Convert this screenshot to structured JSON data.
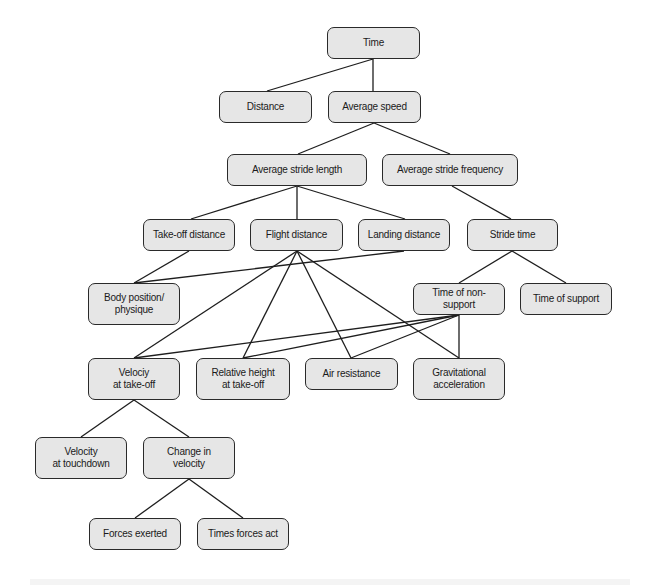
{
  "diagram": {
    "type": "hierarchical-tree",
    "title": "",
    "colors": {
      "node_fill": "#e6e6e6",
      "node_border": "#2a2a2a",
      "edge": "#1e1e1e",
      "background": "#ffffff"
    },
    "nodes": [
      {
        "id": "time",
        "label": "Time",
        "x": 327,
        "y": 27,
        "w": 93,
        "h": 32
      },
      {
        "id": "distance",
        "label": "Distance",
        "x": 219,
        "y": 91,
        "w": 93,
        "h": 32
      },
      {
        "id": "average_speed",
        "label": "Average speed",
        "x": 328,
        "y": 91,
        "w": 93,
        "h": 32
      },
      {
        "id": "avg_stride_length",
        "label": "Average stride length",
        "x": 227,
        "y": 154,
        "w": 140,
        "h": 32
      },
      {
        "id": "avg_stride_frequency",
        "label": "Average stride frequency",
        "x": 382,
        "y": 154,
        "w": 136,
        "h": 32
      },
      {
        "id": "takeoff_distance",
        "label": "Take-off distance",
        "x": 143,
        "y": 219,
        "w": 92,
        "h": 32
      },
      {
        "id": "flight_distance",
        "label": "Flight distance",
        "x": 250,
        "y": 219,
        "w": 93,
        "h": 32
      },
      {
        "id": "landing_distance",
        "label": "Landing distance",
        "x": 358,
        "y": 219,
        "w": 92,
        "h": 32
      },
      {
        "id": "stride_time",
        "label": "Stride time",
        "x": 467,
        "y": 219,
        "w": 91,
        "h": 32
      },
      {
        "id": "body_position",
        "label": "Body position/\nphysique",
        "x": 88,
        "y": 283,
        "w": 92,
        "h": 42
      },
      {
        "id": "time_non_support",
        "label": "Time of non-support",
        "x": 413,
        "y": 283,
        "w": 92,
        "h": 32
      },
      {
        "id": "time_support",
        "label": "Time of support",
        "x": 520,
        "y": 283,
        "w": 92,
        "h": 32
      },
      {
        "id": "velocity_takeoff",
        "label": "Velociy\nat take-off",
        "x": 88,
        "y": 358,
        "w": 92,
        "h": 42
      },
      {
        "id": "relative_height",
        "label": "Relative height\nat take-off",
        "x": 196,
        "y": 358,
        "w": 94,
        "h": 42
      },
      {
        "id": "air_resistance",
        "label": "Air resistance",
        "x": 305,
        "y": 358,
        "w": 93,
        "h": 32
      },
      {
        "id": "gravitational_accel",
        "label": "Gravitational\nacceleration",
        "x": 413,
        "y": 358,
        "w": 92,
        "h": 42
      },
      {
        "id": "velocity_touchdown",
        "label": "Velocity\nat touchdown",
        "x": 35,
        "y": 437,
        "w": 92,
        "h": 42
      },
      {
        "id": "change_velocity",
        "label": "Change in\nvelocity",
        "x": 143,
        "y": 437,
        "w": 92,
        "h": 42
      },
      {
        "id": "forces_exerted",
        "label": "Forces exerted",
        "x": 89,
        "y": 518,
        "w": 92,
        "h": 32
      },
      {
        "id": "times_forces_act",
        "label": "Times forces act",
        "x": 197,
        "y": 518,
        "w": 92,
        "h": 32
      }
    ],
    "edges": [
      {
        "x1": 373,
        "y1": 59,
        "x2": 267,
        "y2": 91
      },
      {
        "x1": 373,
        "y1": 59,
        "x2": 373,
        "y2": 91
      },
      {
        "x1": 374,
        "y1": 123,
        "x2": 298,
        "y2": 154
      },
      {
        "x1": 374,
        "y1": 123,
        "x2": 450,
        "y2": 154
      },
      {
        "x1": 297,
        "y1": 186,
        "x2": 191,
        "y2": 219
      },
      {
        "x1": 297,
        "y1": 186,
        "x2": 297,
        "y2": 219
      },
      {
        "x1": 297,
        "y1": 186,
        "x2": 405,
        "y2": 219
      },
      {
        "x1": 452,
        "y1": 186,
        "x2": 511,
        "y2": 219
      },
      {
        "x1": 189,
        "y1": 251,
        "x2": 134,
        "y2": 283
      },
      {
        "x1": 404,
        "y1": 251,
        "x2": 134,
        "y2": 283
      },
      {
        "x1": 512,
        "y1": 251,
        "x2": 459,
        "y2": 283
      },
      {
        "x1": 512,
        "y1": 251,
        "x2": 566,
        "y2": 283
      },
      {
        "x1": 297,
        "y1": 251,
        "x2": 134,
        "y2": 358
      },
      {
        "x1": 297,
        "y1": 251,
        "x2": 243,
        "y2": 358
      },
      {
        "x1": 297,
        "y1": 251,
        "x2": 351,
        "y2": 358
      },
      {
        "x1": 297,
        "y1": 251,
        "x2": 459,
        "y2": 358
      },
      {
        "x1": 459,
        "y1": 315,
        "x2": 134,
        "y2": 358
      },
      {
        "x1": 459,
        "y1": 315,
        "x2": 243,
        "y2": 358
      },
      {
        "x1": 459,
        "y1": 315,
        "x2": 351,
        "y2": 358
      },
      {
        "x1": 459,
        "y1": 315,
        "x2": 459,
        "y2": 358
      },
      {
        "x1": 134,
        "y1": 400,
        "x2": 81,
        "y2": 437
      },
      {
        "x1": 134,
        "y1": 400,
        "x2": 189,
        "y2": 437
      },
      {
        "x1": 189,
        "y1": 479,
        "x2": 135,
        "y2": 518
      },
      {
        "x1": 189,
        "y1": 479,
        "x2": 243,
        "y2": 518
      }
    ]
  },
  "labels": {
    "time": "Time",
    "distance": "Distance",
    "average_speed": "Average speed",
    "avg_stride_length": "Average stride length",
    "avg_stride_frequency": "Average stride frequency",
    "takeoff_distance": "Take-off distance",
    "flight_distance": "Flight distance",
    "landing_distance": "Landing distance",
    "stride_time": "Stride time",
    "body_position": "Body position/\nphysique",
    "time_non_support": "Time of non-support",
    "time_support": "Time of support",
    "velocity_takeoff": "Velociy\nat take-off",
    "relative_height": "Relative height\nat take-off",
    "air_resistance": "Air resistance",
    "gravitational_accel": "Gravitational\nacceleration",
    "velocity_touchdown": "Velocity\nat touchdown",
    "change_velocity": "Change in\nvelocity",
    "forces_exerted": "Forces exerted",
    "times_forces_act": "Times forces act"
  }
}
